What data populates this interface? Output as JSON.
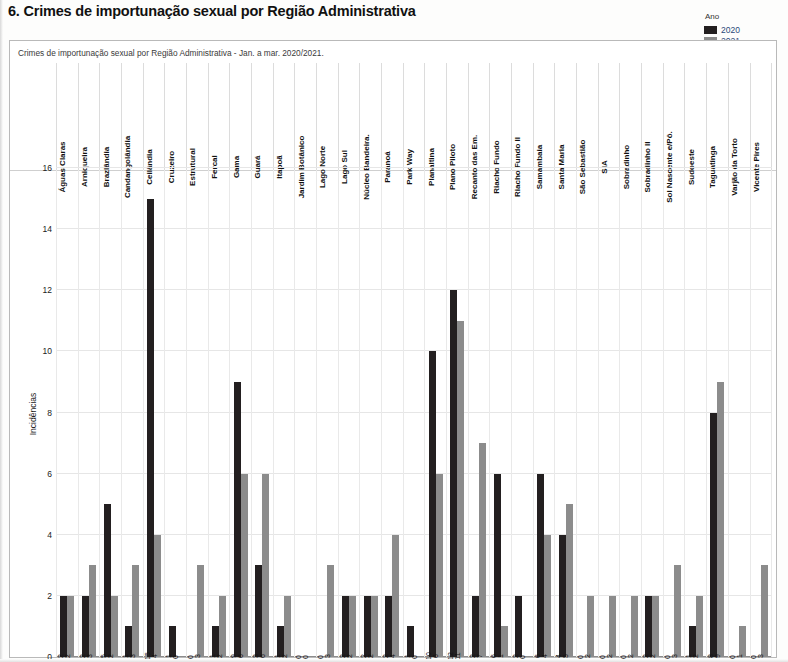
{
  "document": {
    "title": "6. Crimes de importunação sexual por Região Administrativa"
  },
  "legend": {
    "title": "Ano",
    "items": [
      {
        "label": "2020",
        "color": "#231f20"
      },
      {
        "label": "2021",
        "color": "#8c8c8c"
      }
    ]
  },
  "chart_data": {
    "type": "bar",
    "title": "Crimes de importunação sexual por Região Administrativa - Jan. a mar. 2020/2021.",
    "xlabel": "",
    "ylabel": "Incidências",
    "ylim": [
      0,
      16
    ],
    "yticks": [
      0,
      2,
      4,
      6,
      8,
      10,
      12,
      14,
      16
    ],
    "grid": true,
    "legend_position": "top-right",
    "categories": [
      "Águas Claras",
      "Arniqueira",
      "Brazlândia",
      "Candangolândia",
      "Ceilândia",
      "Cruzeiro",
      "Estrutural",
      "Fercal",
      "Gama",
      "Guará",
      "Itapoã",
      "Jardim Botânico",
      "Lago Norte",
      "Lago Sul",
      "Núcleo Bandeira.",
      "Paranoá",
      "Park Way",
      "Planaltina",
      "Plano Piloto",
      "Recanto das Em.",
      "Riacho Fundo",
      "Riacho Fundo II",
      "Samambaia",
      "Santa Maria",
      "São Sebastião",
      "SIA",
      "Sobradinho",
      "Sobradinho II",
      "Sol Nascente e/Pô.",
      "Sudoeste",
      "Taguatinga",
      "Varjão da Torto",
      "Vicente Pires"
    ],
    "series": [
      {
        "name": "2020",
        "color": "#231f20",
        "values": [
          2,
          2,
          5,
          1,
          15,
          1,
          0,
          1,
          9,
          3,
          1,
          0,
          0,
          2,
          2,
          2,
          1,
          10,
          12,
          2,
          6,
          2,
          6,
          4,
          0,
          0,
          0,
          2,
          0,
          1,
          8,
          0,
          0
        ]
      },
      {
        "name": "2021",
        "color": "#8c8c8c",
        "values": [
          2,
          3,
          2,
          3,
          4,
          0,
          3,
          2,
          6,
          6,
          2,
          0,
          3,
          2,
          2,
          4,
          0,
          6,
          11,
          7,
          1,
          0,
          4,
          5,
          2,
          2,
          2,
          2,
          3,
          2,
          9,
          1,
          3
        ]
      }
    ]
  }
}
